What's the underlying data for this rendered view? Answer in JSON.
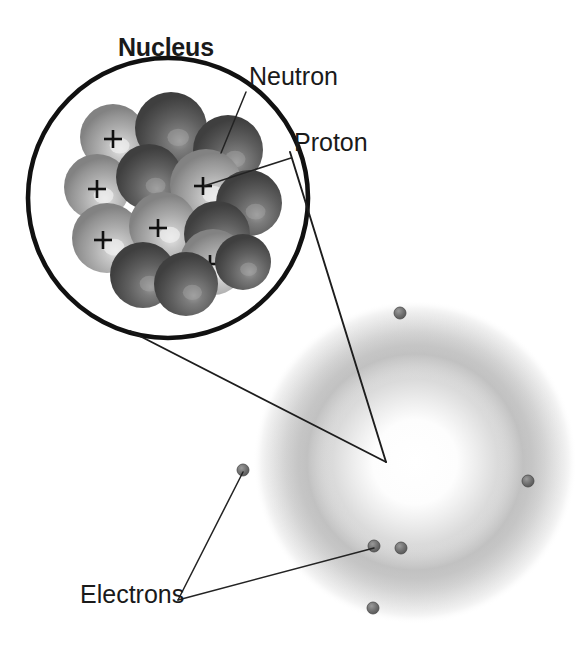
{
  "figure": {
    "background_color": "#ffffff"
  },
  "labels": {
    "nucleus": "Nucleus",
    "neutron": "Neutron",
    "proton": "Proton",
    "electrons": "Electrons"
  },
  "colors": {
    "label_text": "#1a1a1a",
    "leader_line": "#1d1d1d",
    "magnifier_outline": "#111111",
    "proton_sphere": "#a9a9a9",
    "neutron_sphere": "#5c5c5c",
    "electron_dot": "#6e6e6e",
    "electron_cloud": "#b9b9b9",
    "plus_sign": "#111111"
  },
  "magnifier": {
    "center_x": 168,
    "center_y": 198,
    "radius": 140,
    "stroke_width": 4.6
  },
  "electron_cloud": {
    "center_x": 415,
    "center_y": 462,
    "outer_radius": 162,
    "core_radius": 66,
    "ring_peak_radius": 120
  },
  "nucleus_particles": [
    {
      "id": "p1",
      "type": "proton",
      "cx": 113,
      "cy": 137,
      "r": 33,
      "charge": "+",
      "charge_x": 113,
      "charge_y": 139
    },
    {
      "id": "n1",
      "type": "neutron",
      "cx": 171,
      "cy": 128,
      "r": 36,
      "charge": ""
    },
    {
      "id": "n2",
      "type": "neutron",
      "cx": 228,
      "cy": 150,
      "r": 35,
      "charge": ""
    },
    {
      "id": "p2",
      "type": "proton",
      "cx": 97,
      "cy": 187,
      "r": 33,
      "charge": "+",
      "charge_x": 97,
      "charge_y": 189
    },
    {
      "id": "n3",
      "type": "neutron",
      "cx": 149,
      "cy": 177,
      "r": 33,
      "charge": ""
    },
    {
      "id": "p3",
      "type": "proton",
      "cx": 206,
      "cy": 185,
      "r": 36,
      "charge": "+",
      "charge_x": 203,
      "charge_y": 186
    },
    {
      "id": "n4",
      "type": "neutron",
      "cx": 249,
      "cy": 203,
      "r": 33,
      "charge": ""
    },
    {
      "id": "p4",
      "type": "proton",
      "cx": 107,
      "cy": 238,
      "r": 35,
      "charge": "+",
      "charge_x": 103,
      "charge_y": 240
    },
    {
      "id": "p5",
      "type": "proton",
      "cx": 163,
      "cy": 226,
      "r": 34,
      "charge": "+",
      "charge_x": 158,
      "charge_y": 228
    },
    {
      "id": "n5",
      "type": "neutron",
      "cx": 217,
      "cy": 234,
      "r": 33,
      "charge": ""
    },
    {
      "id": "p6",
      "type": "proton",
      "cx": 213,
      "cy": 262,
      "r": 33,
      "charge": "+",
      "charge_x": 210,
      "charge_y": 264
    },
    {
      "id": "n6",
      "type": "neutron",
      "cx": 143,
      "cy": 275,
      "r": 33,
      "charge": ""
    },
    {
      "id": "n7",
      "type": "neutron",
      "cx": 186,
      "cy": 284,
      "r": 32,
      "charge": ""
    },
    {
      "id": "n8",
      "type": "neutron",
      "cx": 243,
      "cy": 262,
      "r": 28,
      "charge": ""
    }
  ],
  "electrons": [
    {
      "id": "e1",
      "cx": 400,
      "cy": 313,
      "r": 6
    },
    {
      "id": "e2",
      "cx": 528,
      "cy": 481,
      "r": 6
    },
    {
      "id": "e3",
      "cx": 243,
      "cy": 470,
      "r": 6
    },
    {
      "id": "e4",
      "cx": 374,
      "cy": 546,
      "r": 6
    },
    {
      "id": "e5",
      "cx": 401,
      "cy": 548,
      "r": 6
    },
    {
      "id": "e6",
      "cx": 373,
      "cy": 608,
      "r": 6
    }
  ],
  "label_positions": {
    "nucleus": {
      "x": 118,
      "y": 56
    },
    "neutron": {
      "x": 249,
      "y": 85
    },
    "proton": {
      "x": 294,
      "y": 151
    },
    "electrons": {
      "x": 80,
      "y": 603
    }
  },
  "leader_lines": {
    "neutron": "M246,92 L221,153",
    "proton": "M291,158 L204,186",
    "magnify_upper": "M290,152 L386,462",
    "magnify_lower": "M130,331 L386,462",
    "electron_left": "M243,472 L178,600",
    "electron_bottom": "M374,548 L178,600"
  }
}
